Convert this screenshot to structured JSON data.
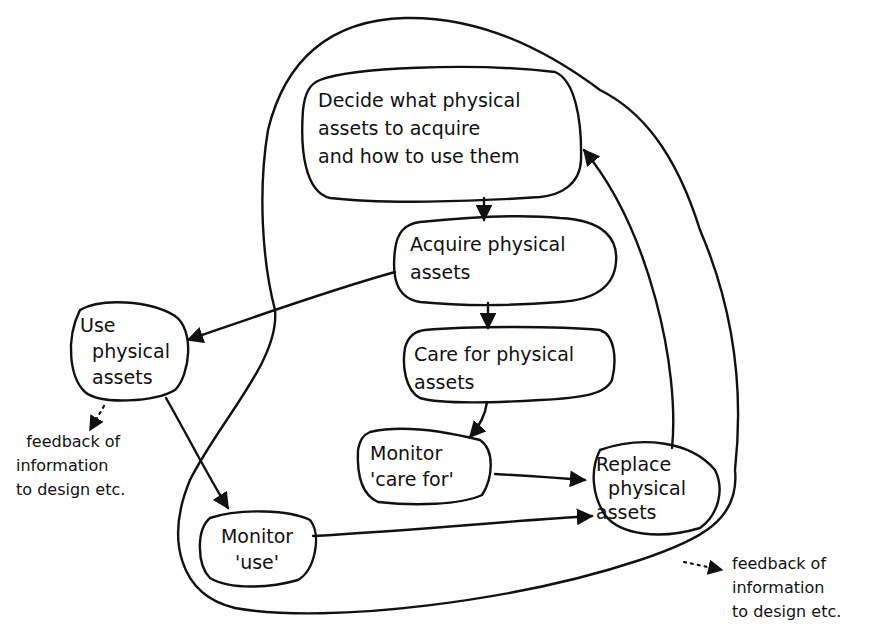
{
  "diagram": {
    "type": "hand-drawn flow diagram",
    "nodes": {
      "decide": {
        "text": "Decide what physical\nassets to acquire\nand how to use them"
      },
      "acquire": {
        "text": "Acquire physical\nassets"
      },
      "care": {
        "text": "Care for physical\nassets"
      },
      "use": {
        "text": "Use\n  physical\n  assets"
      },
      "monitor_care": {
        "text": "Monitor\n'care for'"
      },
      "monitor_use": {
        "text": "Monitor\n'use'"
      },
      "replace": {
        "text": "Replace\n  physical\nassets"
      }
    },
    "annotations": {
      "feedback_left": "  feedback of\ninformation\nto design etc.",
      "feedback_right": "feedback of\ninformation\nto design etc."
    },
    "edges": [
      {
        "from": "decide",
        "to": "acquire"
      },
      {
        "from": "acquire",
        "to": "care"
      },
      {
        "from": "acquire",
        "to": "use"
      },
      {
        "from": "care",
        "to": "monitor_care"
      },
      {
        "from": "use",
        "to": "monitor_use"
      },
      {
        "from": "monitor_care",
        "to": "replace"
      },
      {
        "from": "monitor_use",
        "to": "replace"
      },
      {
        "from": "replace",
        "to": "decide"
      },
      {
        "from": "use",
        "to": "feedback_left",
        "style": "dotted"
      },
      {
        "from": "outer-loop",
        "to": "feedback_right",
        "style": "dotted"
      }
    ]
  }
}
